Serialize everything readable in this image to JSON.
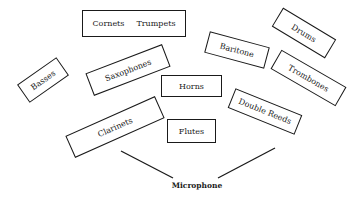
{
  "diagram": {
    "sections": {
      "cornets_trumpets": {
        "label_a": "Cornets",
        "label_b": "Trumpets"
      },
      "drums": {
        "label": "Drums"
      },
      "baritone": {
        "label": "Baritone"
      },
      "basses": {
        "label": "Basses"
      },
      "saxophones": {
        "label": "Saxophones"
      },
      "horns": {
        "label": "Horns"
      },
      "trombones": {
        "label": "Trombones"
      },
      "double_reeds": {
        "label": "Double Reeds"
      },
      "clarinets": {
        "label": "Clarinets"
      },
      "flutes": {
        "label": "Flutes"
      }
    },
    "microphone": {
      "label": "Microphone"
    },
    "colors": {
      "ink": "#1a1a1a",
      "background": "#ffffff"
    }
  }
}
